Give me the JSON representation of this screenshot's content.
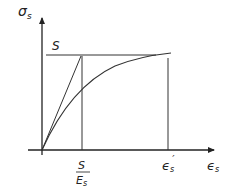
{
  "diagram": {
    "y_axis": {
      "label": "σ",
      "sub": "s"
    },
    "x_axis": {
      "label": "ϵ",
      "sub": "s"
    },
    "labels": {
      "yield_stress": "S",
      "fraction_num": "S",
      "fraction_den": "E",
      "fraction_den_sub": "s",
      "strain_prime": "ϵ",
      "strain_prime_sub": "s",
      "strain_prime_mark": "′"
    },
    "colors": {
      "line": "#2a2a2a",
      "background": "#ffffff"
    }
  }
}
